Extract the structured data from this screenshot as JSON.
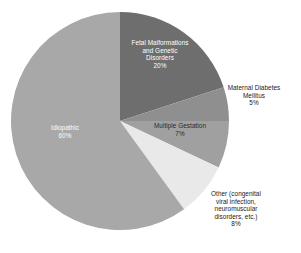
{
  "chart_data": {
    "type": "pie",
    "title": "",
    "subtitle": "",
    "xlabel": "",
    "ylabel": "",
    "grid": false,
    "legend_position": "none",
    "label_format": "name + percent",
    "start_angle_deg": 0,
    "direction": "clockwise",
    "total_percent": 100,
    "categories": [
      "Fetal Malformations and Genetic Disorders",
      "Maternal Diabetes Mellitus",
      "Multiple Gestation",
      "Other (congenital viral infection, neuromuscular disorders, etc.)",
      "Idiopathic"
    ],
    "values": [
      20,
      5,
      7,
      8,
      60
    ],
    "slices": [
      {
        "name": "Fetal Malformations and Genetic Disorders",
        "value": 20,
        "percent_label": "20%",
        "color": "#6e6e6e",
        "label_lines": [
          "Fetal Malformations",
          "and Genetic",
          "Disorders",
          "20%"
        ],
        "label_placement": "inside",
        "label_color": "#ffffff",
        "start_deg": 0,
        "end_deg": 72
      },
      {
        "name": "Maternal Diabetes Mellitus",
        "value": 5,
        "percent_label": "5%",
        "color": "#8f8f8f",
        "label_lines": [
          "Maternal Diabetes",
          "Mellitus",
          "5%"
        ],
        "label_placement": "outside",
        "label_color": "#1a1a1a",
        "start_deg": 72,
        "end_deg": 90
      },
      {
        "name": "Multiple Gestation",
        "value": 7,
        "percent_label": "7%",
        "color": "#a0a0a0",
        "label_lines": [
          "Multiple Gestation",
          "7%"
        ],
        "label_placement": "inside",
        "label_color": "#2b2b2b",
        "start_deg": 90,
        "end_deg": 115.2
      },
      {
        "name": "Other (congenital viral infection, neuromuscular disorders, etc.)",
        "value": 8,
        "percent_label": "8%",
        "color": "#e9e9e9",
        "label_lines": [
          "Other (congenital",
          "viral infection,",
          "neuromuscular",
          "disorders, etc.)",
          "8%"
        ],
        "label_placement": "outside",
        "label_color": "#1a1a1a",
        "start_deg": 115.2,
        "end_deg": 144
      },
      {
        "name": "Idiopathic",
        "value": 60,
        "percent_label": "60%",
        "color": "#a8a8a8",
        "label_lines": [
          "Idiopathic",
          "60%"
        ],
        "label_placement": "inside",
        "label_color": "#ffffff",
        "start_deg": 144,
        "end_deg": 360
      }
    ]
  },
  "geometry": {
    "center_x": 120,
    "center_y": 121,
    "radius": 109
  }
}
